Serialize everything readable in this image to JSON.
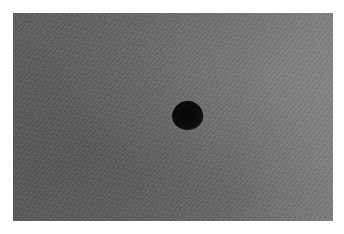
{
  "image": {
    "description": "Grayscale photograph of a textured gray surface with a single dark circular spot",
    "background_color": "#ffffff",
    "surface_color_left": "#5c5c5c",
    "surface_color_right": "#7c7c7c",
    "spot": {
      "color": "#080808",
      "center_x": 187,
      "center_y": 115,
      "width": 31,
      "height": 29
    }
  }
}
